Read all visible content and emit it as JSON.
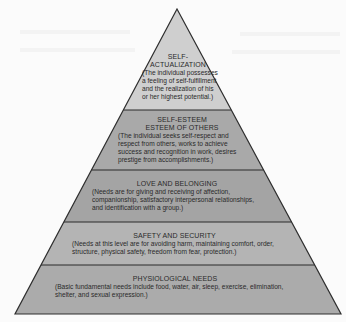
{
  "diagram": {
    "type": "pyramid",
    "colors": {
      "background": "#fbfbfb",
      "outline": "#333333",
      "layer_top": "#cfcfcf",
      "layer_esteem": "#a9a9a9",
      "layer_love": "#a4a4a4",
      "layer_safety": "#b4b4b4",
      "layer_physiological": "#ababab"
    },
    "layers": [
      {
        "title": "SELF-\nACTUALIZATION",
        "title_line1": "SELF-",
        "title_line2": "ACTUALIZATION",
        "description": "(The individual possesses a feeling of self-fulfillment and the realization of his or her highest potential.)"
      },
      {
        "title_line1": "SELF-ESTEEM",
        "title_line2": "ESTEEM OF OTHERS",
        "description": "(The individual seeks self-respect and respect from others, works to achieve success and recognition in work, desires prestige from accomplishments.)"
      },
      {
        "title": "LOVE AND BELONGING",
        "description": "(Needs are for giving and receiving of affection, companionship, satisfactory interpersonal relationships, and identification with a group.)"
      },
      {
        "title": "SAFETY AND SECURITY",
        "description": "(Needs at this level are for avoiding harm, maintaining comfort, order, structure, physical safety, freedom from fear, protection.)"
      },
      {
        "title": "PHYSIOLOGICAL NEEDS",
        "description": "(Basic fundamental needs include food, water, air, sleep, exercise, elimination, shelter, and sexual expression.)"
      }
    ]
  }
}
